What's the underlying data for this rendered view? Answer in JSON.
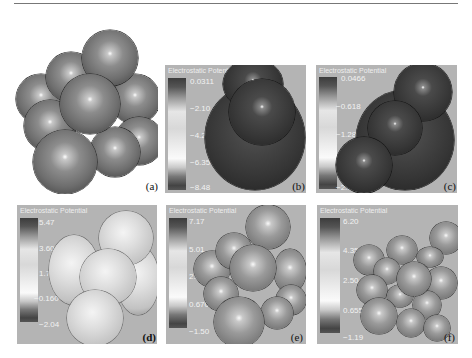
{
  "figure": {
    "top_rule": true,
    "panels": [
      {
        "id": "a",
        "label": "(a)",
        "title": "",
        "type": "ball-model",
        "colorbar": null
      },
      {
        "id": "b",
        "label": "(b)",
        "title": "Electrostatic Potential",
        "type": "potential-surface",
        "colorbar": {
          "ticks": [
            "0.0311",
            "−2.10",
            "−4.22",
            "−6.35",
            "−8.48"
          ]
        }
      },
      {
        "id": "c",
        "label": "(c)",
        "title": "Electrostatic Potential",
        "type": "potential-surface",
        "colorbar": {
          "ticks": [
            "0.0466",
            "−0.618",
            "−1.28",
            "−1.95",
            "−2.61"
          ]
        }
      },
      {
        "id": "d",
        "label": "(d)",
        "title": "Electrostatic Potential",
        "type": "potential-surface",
        "colorbar": {
          "ticks": [
            "5.47",
            "3.60",
            "1.72",
            "−0.160",
            "−2.04"
          ]
        }
      },
      {
        "id": "e",
        "label": "(e)",
        "title": "Electrostatic Potential",
        "type": "potential-surface",
        "colorbar": {
          "ticks": [
            "7.17",
            "5.01",
            "2.84",
            "0.670",
            "−1.50"
          ]
        }
      },
      {
        "id": "f",
        "label": "(f)",
        "title": "Electrostatic Potential",
        "type": "potential-surface",
        "colorbar": {
          "ticks": [
            "6.20",
            "4.35",
            "2.50",
            "0.655",
            "−1.19"
          ]
        }
      }
    ]
  }
}
